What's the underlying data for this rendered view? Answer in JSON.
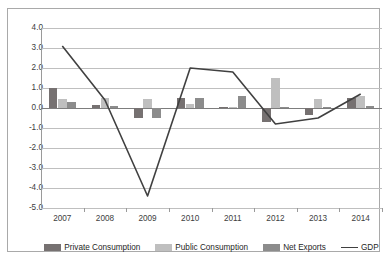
{
  "chart_data": {
    "type": "bar",
    "title": "",
    "subtitle": "",
    "xlabel": "",
    "ylabel": "",
    "categories": [
      "2007",
      "2008",
      "2009",
      "2010",
      "2011",
      "2012",
      "2013",
      "2014"
    ],
    "ylim": [
      -5.0,
      4.0
    ],
    "ytick_labels": [
      "4.0",
      "3.0",
      "2.0",
      "1.0",
      "0.0",
      "-1.0",
      "-2.0",
      "-3.0",
      "-4.0",
      "-5.0"
    ],
    "ytick_values": [
      4.0,
      3.0,
      2.0,
      1.0,
      0.0,
      -1.0,
      -2.0,
      -3.0,
      -4.0,
      -5.0
    ],
    "grid": true,
    "legend_position": "bottom",
    "series": [
      {
        "name": "Private Consumption",
        "kind": "bar",
        "color": "#767171",
        "values": [
          1.0,
          0.15,
          -0.5,
          0.5,
          0.05,
          -0.7,
          -0.35,
          0.5
        ]
      },
      {
        "name": "Public Consumption",
        "kind": "bar",
        "color": "#bfbfbf",
        "values": [
          0.45,
          0.5,
          0.45,
          0.2,
          0.05,
          1.5,
          0.45,
          0.6
        ]
      },
      {
        "name": "Net Exports",
        "kind": "bar",
        "color": "#8c8c8c",
        "values": [
          0.3,
          0.12,
          -0.5,
          0.5,
          0.6,
          0.05,
          0.05,
          0.1
        ]
      },
      {
        "name": "GDP",
        "kind": "line",
        "color": "#404040",
        "values": [
          3.1,
          0.4,
          -4.4,
          2.0,
          1.8,
          -0.8,
          -0.5,
          0.7
        ]
      }
    ]
  },
  "legend": {
    "items": [
      {
        "label": "Private Consumption",
        "swatch": "square-swatch-private"
      },
      {
        "label": "Public Consumption",
        "swatch": "square-swatch-public"
      },
      {
        "label": "Net Exports",
        "swatch": "square-swatch-netexports"
      },
      {
        "label": "GDP",
        "swatch": "line-swatch-gdp"
      }
    ]
  }
}
